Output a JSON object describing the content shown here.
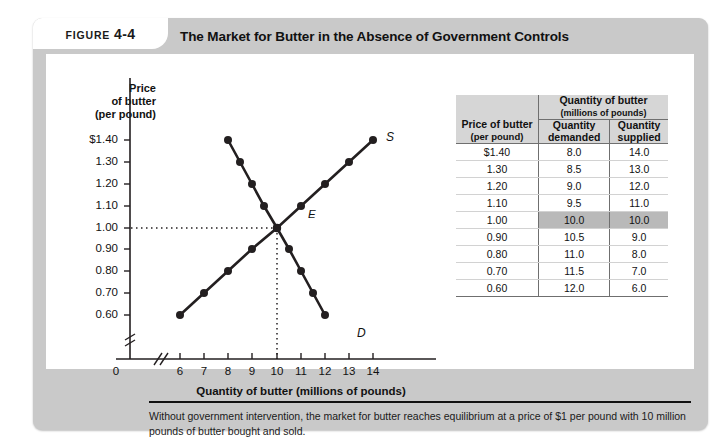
{
  "figure": {
    "label_word": "FIGURE",
    "label_number": "4-4",
    "title": "The Market for Butter in the Absence of Government Controls",
    "caption": "Without government intervention, the market for butter reaches equilibrium at a price of $1 per pound with 10 million pounds of butter bought and sold."
  },
  "axes": {
    "y_title": "Price\nof butter\n(per pound)",
    "y_title_line1": "Price",
    "y_title_line2": "of butter",
    "y_title_line3": "(per pound)",
    "x_title": "Quantity of butter (millions of pounds)",
    "origin": "0",
    "y_ticks": [
      "$1.40",
      "1.30",
      "1.20",
      "1.10",
      "1.00",
      "0.90",
      "0.80",
      "0.70",
      "0.60"
    ],
    "x_ticks": [
      "6",
      "7",
      "8",
      "9",
      "10",
      "11",
      "12",
      "13",
      "14"
    ]
  },
  "curve_labels": {
    "supply": "S",
    "demand": "D",
    "equilibrium": "E"
  },
  "table": {
    "header_price": "Price of butter",
    "header_price_sub": "(per pound)",
    "header_group": "Quantity of butter",
    "header_group_sub": "(millions of pounds)",
    "header_demanded_line1": "Quantity",
    "header_demanded_line2": "demanded",
    "header_supplied_line1": "Quantity",
    "header_supplied_line2": "supplied",
    "rows": [
      {
        "price": "$1.40",
        "demanded": "8.0",
        "supplied": "14.0",
        "equilibrium": false
      },
      {
        "price": "1.30",
        "demanded": "8.5",
        "supplied": "13.0",
        "equilibrium": false
      },
      {
        "price": "1.20",
        "demanded": "9.0",
        "supplied": "12.0",
        "equilibrium": false
      },
      {
        "price": "1.10",
        "demanded": "9.5",
        "supplied": "11.0",
        "equilibrium": false
      },
      {
        "price": "1.00",
        "demanded": "10.0",
        "supplied": "10.0",
        "equilibrium": true
      },
      {
        "price": "0.90",
        "demanded": "10.5",
        "supplied": "9.0",
        "equilibrium": false
      },
      {
        "price": "0.80",
        "demanded": "11.0",
        "supplied": "8.0",
        "equilibrium": false
      },
      {
        "price": "0.70",
        "demanded": "11.5",
        "supplied": "7.0",
        "equilibrium": false
      },
      {
        "price": "0.60",
        "demanded": "12.0",
        "supplied": "6.0",
        "equilibrium": false
      }
    ]
  },
  "colors": {
    "panel_background": "#c9c9c9",
    "content_background": "#ffffff",
    "curve": "#231f20",
    "table_header": "#d6d6d6",
    "highlight_row": "#b9b9b9",
    "text": "#111111"
  },
  "chart_data": {
    "type": "line",
    "title": "The Market for Butter in the Absence of Government Controls",
    "xlabel": "Quantity of butter (millions of pounds)",
    "ylabel": "Price of butter (per pound)",
    "xlim": [
      6,
      14
    ],
    "ylim": [
      0.6,
      1.4
    ],
    "xticks": [
      6,
      7,
      8,
      9,
      10,
      11,
      12,
      13,
      14
    ],
    "yticks": [
      0.6,
      0.7,
      0.8,
      0.9,
      1.0,
      1.1,
      1.2,
      1.3,
      1.4
    ],
    "grid": false,
    "axis_break_x": true,
    "axis_break_y": true,
    "markers": "filled-circle",
    "series": [
      {
        "name": "D",
        "label": "Demand",
        "x": [
          8.0,
          8.5,
          9.0,
          9.5,
          10.0,
          10.5,
          11.0,
          11.5,
          12.0
        ],
        "y": [
          1.4,
          1.3,
          1.2,
          1.1,
          1.0,
          0.9,
          0.8,
          0.7,
          0.6
        ]
      },
      {
        "name": "S",
        "label": "Supply",
        "x": [
          14.0,
          13.0,
          12.0,
          11.0,
          10.0,
          9.0,
          8.0,
          7.0,
          6.0
        ],
        "y": [
          1.4,
          1.3,
          1.2,
          1.1,
          1.0,
          0.9,
          0.8,
          0.7,
          0.6
        ]
      }
    ],
    "annotations": [
      {
        "label": "E",
        "x": 10.0,
        "y": 1.0,
        "note": "equilibrium point"
      }
    ],
    "guide_lines": [
      {
        "type": "horizontal",
        "y": 1.0,
        "style": "dotted",
        "from_x": 6.0,
        "to_x": 10.0
      },
      {
        "type": "vertical",
        "x": 10.0,
        "style": "dotted",
        "from_y": 0.6,
        "to_y": 1.0
      }
    ]
  }
}
